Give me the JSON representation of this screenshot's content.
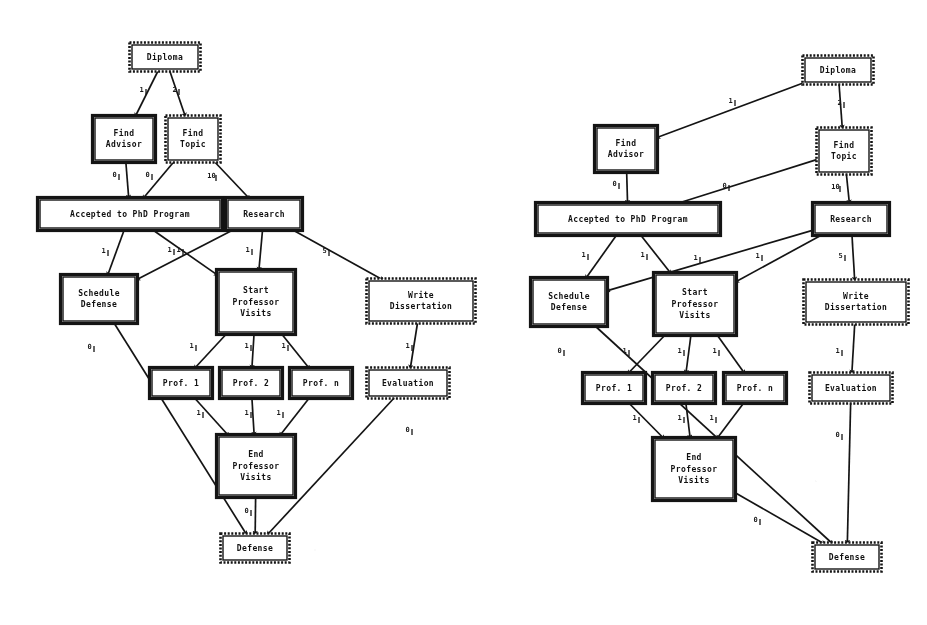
{
  "figure": {
    "kind": "task-graph-pair",
    "background_color": "#ffffff",
    "ink_color": "#141414"
  },
  "nodes": {
    "diploma": "Diploma",
    "find_advisor": "Find\nAdvisor",
    "find_topic": "Find\nTopic",
    "accepted": "Accepted to PhD Program",
    "research": "Research",
    "schedule_defense": "Schedule\nDefense",
    "start_visits": "Start\nProfessor\nVisits",
    "write_dissertation": "Write\nDissertation",
    "prof1": "Prof. 1",
    "prof2": "Prof. 2",
    "profn": "Prof. n",
    "evaluation": "Evaluation",
    "end_visits": "End\nProfessor\nVisits",
    "defense": "Defense"
  },
  "left_diagram": {
    "name": "left-task-graph",
    "nodes": [
      {
        "id": "diploma",
        "label": "Diploma",
        "x": 132,
        "y": 45,
        "w": 66,
        "h": 24,
        "style": "dotted",
        "lines": [
          "Diploma"
        ],
        "font": 8
      },
      {
        "id": "find_advisor",
        "label": "Find Advisor",
        "x": 95,
        "y": 118,
        "w": 58,
        "h": 42,
        "style": "solid",
        "lines": [
          "Find",
          "Advisor"
        ],
        "font": 8
      },
      {
        "id": "find_topic",
        "label": "Find Topic",
        "x": 168,
        "y": 118,
        "w": 50,
        "h": 42,
        "style": "dotted",
        "lines": [
          "Find",
          "Topic"
        ],
        "font": 8
      },
      {
        "id": "accepted",
        "label": "Accepted to PhD Program",
        "x": 40,
        "y": 200,
        "w": 180,
        "h": 28,
        "style": "solid",
        "lines": [
          "Accepted to PhD Program"
        ],
        "font": 8
      },
      {
        "id": "research",
        "label": "Research",
        "x": 228,
        "y": 200,
        "w": 72,
        "h": 28,
        "style": "solid",
        "lines": [
          "Research"
        ],
        "font": 8
      },
      {
        "id": "schedule_defense",
        "label": "Schedule Defense",
        "x": 63,
        "y": 277,
        "w": 72,
        "h": 44,
        "style": "solid",
        "lines": [
          "Schedule",
          "Defense"
        ],
        "font": 8
      },
      {
        "id": "start_visits",
        "label": "Start Professor Visits",
        "x": 219,
        "y": 272,
        "w": 74,
        "h": 60,
        "style": "solid",
        "lines": [
          "Start",
          "Professor",
          "Visits"
        ],
        "font": 8
      },
      {
        "id": "write_dissertation",
        "label": "Write Dissertation",
        "x": 369,
        "y": 281,
        "w": 104,
        "h": 40,
        "style": "dotted",
        "lines": [
          "Write",
          "Dissertation"
        ],
        "font": 8
      },
      {
        "id": "prof1",
        "label": "Prof. 1",
        "x": 152,
        "y": 370,
        "w": 58,
        "h": 26,
        "style": "solid",
        "lines": [
          "Prof. 1"
        ],
        "font": 8
      },
      {
        "id": "prof2",
        "label": "Prof. 2",
        "x": 222,
        "y": 370,
        "w": 58,
        "h": 26,
        "style": "solid",
        "lines": [
          "Prof. 2"
        ],
        "font": 8
      },
      {
        "id": "profn",
        "label": "Prof. n",
        "x": 292,
        "y": 370,
        "w": 58,
        "h": 26,
        "style": "solid",
        "lines": [
          "Prof. n"
        ],
        "font": 8
      },
      {
        "id": "evaluation",
        "label": "Evaluation",
        "x": 369,
        "y": 370,
        "w": 78,
        "h": 26,
        "style": "dotted",
        "lines": [
          "Evaluation"
        ],
        "font": 8
      },
      {
        "id": "end_visits",
        "label": "End Professor Visits",
        "x": 219,
        "y": 437,
        "w": 74,
        "h": 58,
        "style": "solid",
        "lines": [
          "End",
          "Professor",
          "Visits"
        ],
        "font": 8
      },
      {
        "id": "defense",
        "label": "Defense",
        "x": 223,
        "y": 536,
        "w": 64,
        "h": 24,
        "style": "dotted",
        "lines": [
          "Defense"
        ],
        "font": 8
      }
    ],
    "edges": [
      {
        "from": "diploma",
        "to": "find_advisor",
        "weight": "1",
        "lx": 146,
        "ly": 92
      },
      {
        "from": "diploma",
        "to": "find_topic",
        "weight": "2",
        "lx": 179,
        "ly": 92
      },
      {
        "from": "find_advisor",
        "to": "accepted",
        "weight": "0",
        "lx": 119,
        "ly": 177
      },
      {
        "from": "find_topic",
        "to": "accepted",
        "weight": "0",
        "lx": 152,
        "ly": 177
      },
      {
        "from": "find_topic",
        "to": "research",
        "weight": "10",
        "lx": 216,
        "ly": 178
      },
      {
        "from": "accepted",
        "to": "schedule_defense",
        "weight": "1",
        "lx": 108,
        "ly": 253
      },
      {
        "from": "accepted",
        "to": "start_visits",
        "weight": "1",
        "lx": 183,
        "ly": 252
      },
      {
        "from": "research",
        "to": "schedule_defense",
        "weight": "1",
        "lx": 174,
        "ly": 252
      },
      {
        "from": "research",
        "to": "start_visits",
        "weight": "1",
        "lx": 252,
        "ly": 252
      },
      {
        "from": "research",
        "to": "write_dissertation",
        "weight": "5",
        "lx": 329,
        "ly": 253
      },
      {
        "from": "schedule_defense",
        "to": "defense",
        "weight": "0",
        "lx": 94,
        "ly": 349
      },
      {
        "from": "start_visits",
        "to": "prof1",
        "weight": "1",
        "lx": 196,
        "ly": 348
      },
      {
        "from": "start_visits",
        "to": "prof2",
        "weight": "1",
        "lx": 251,
        "ly": 348
      },
      {
        "from": "start_visits",
        "to": "profn",
        "weight": "1",
        "lx": 288,
        "ly": 348
      },
      {
        "from": "write_dissertation",
        "to": "evaluation",
        "weight": "1",
        "lx": 412,
        "ly": 348
      },
      {
        "from": "prof1",
        "to": "end_visits",
        "weight": "1",
        "lx": 203,
        "ly": 415
      },
      {
        "from": "prof2",
        "to": "end_visits",
        "weight": "1",
        "lx": 251,
        "ly": 415
      },
      {
        "from": "profn",
        "to": "end_visits",
        "weight": "1",
        "lx": 283,
        "ly": 415
      },
      {
        "from": "evaluation",
        "to": "defense",
        "weight": "0",
        "lx": 412,
        "ly": 432
      },
      {
        "from": "end_visits",
        "to": "defense",
        "weight": "0",
        "lx": 251,
        "ly": 513
      }
    ]
  },
  "right_diagram": {
    "name": "right-task-graph",
    "nodes": [
      {
        "id": "diploma",
        "label": "Diploma",
        "x": 805,
        "y": 58,
        "w": 66,
        "h": 24,
        "style": "dotted",
        "lines": [
          "Diploma"
        ],
        "font": 8
      },
      {
        "id": "find_advisor",
        "label": "Find Advisor",
        "x": 597,
        "y": 128,
        "w": 58,
        "h": 42,
        "style": "solid",
        "lines": [
          "Find",
          "Advisor"
        ],
        "font": 8
      },
      {
        "id": "find_topic",
        "label": "Find Topic",
        "x": 819,
        "y": 130,
        "w": 50,
        "h": 42,
        "style": "dotted",
        "lines": [
          "Find",
          "Topic"
        ],
        "font": 8
      },
      {
        "id": "accepted",
        "label": "Accepted to PhD Program",
        "x": 538,
        "y": 205,
        "w": 180,
        "h": 28,
        "style": "solid",
        "lines": [
          "Accepted to PhD Program"
        ],
        "font": 8
      },
      {
        "id": "research",
        "label": "Research",
        "x": 815,
        "y": 205,
        "w": 72,
        "h": 28,
        "style": "solid",
        "lines": [
          "Research"
        ],
        "font": 8
      },
      {
        "id": "schedule_defense",
        "label": "Schedule Defense",
        "x": 533,
        "y": 280,
        "w": 72,
        "h": 44,
        "style": "solid",
        "lines": [
          "Schedule",
          "Defense"
        ],
        "font": 8
      },
      {
        "id": "start_visits",
        "label": "Start Professor Visits",
        "x": 656,
        "y": 275,
        "w": 78,
        "h": 58,
        "style": "solid",
        "lines": [
          "Start",
          "Professor",
          "Visits"
        ],
        "font": 8
      },
      {
        "id": "write_dissertation",
        "label": "Write Dissertation",
        "x": 806,
        "y": 282,
        "w": 100,
        "h": 40,
        "style": "dotted",
        "lines": [
          "Write",
          "Dissertation"
        ],
        "font": 8
      },
      {
        "id": "prof1",
        "label": "Prof. 1",
        "x": 585,
        "y": 375,
        "w": 58,
        "h": 26,
        "style": "solid",
        "lines": [
          "Prof. 1"
        ],
        "font": 8
      },
      {
        "id": "prof2",
        "label": "Prof. 2",
        "x": 655,
        "y": 375,
        "w": 58,
        "h": 26,
        "style": "solid",
        "lines": [
          "Prof. 2"
        ],
        "font": 8
      },
      {
        "id": "profn",
        "label": "Prof. n",
        "x": 726,
        "y": 375,
        "w": 58,
        "h": 26,
        "style": "solid",
        "lines": [
          "Prof. n"
        ],
        "font": 8
      },
      {
        "id": "evaluation",
        "label": "Evaluation",
        "x": 812,
        "y": 375,
        "w": 78,
        "h": 26,
        "style": "dotted",
        "lines": [
          "Evaluation"
        ],
        "font": 8
      },
      {
        "id": "end_visits",
        "label": "End Professor Visits",
        "x": 655,
        "y": 440,
        "w": 78,
        "h": 58,
        "style": "solid",
        "lines": [
          "End",
          "Professor",
          "Visits"
        ],
        "font": 8
      },
      {
        "id": "defense",
        "label": "Defense",
        "x": 815,
        "y": 545,
        "w": 64,
        "h": 24,
        "style": "dotted",
        "lines": [
          "Defense"
        ],
        "font": 8
      }
    ],
    "edges": [
      {
        "from": "diploma",
        "to": "find_advisor",
        "weight": "1",
        "lx": 735,
        "ly": 103
      },
      {
        "from": "diploma",
        "to": "find_topic",
        "weight": "2",
        "lx": 844,
        "ly": 105
      },
      {
        "from": "find_advisor",
        "to": "accepted",
        "weight": "0",
        "lx": 619,
        "ly": 186
      },
      {
        "from": "find_topic",
        "to": "accepted",
        "weight": "0",
        "lx": 729,
        "ly": 188
      },
      {
        "from": "find_topic",
        "to": "research",
        "weight": "10",
        "lx": 840,
        "ly": 189
      },
      {
        "from": "accepted",
        "to": "schedule_defense",
        "weight": "1",
        "lx": 588,
        "ly": 257
      },
      {
        "from": "accepted",
        "to": "start_visits",
        "weight": "1",
        "lx": 647,
        "ly": 257
      },
      {
        "from": "research",
        "to": "schedule_defense",
        "weight": "1",
        "lx": 700,
        "ly": 260
      },
      {
        "from": "research",
        "to": "start_visits",
        "weight": "1",
        "lx": 762,
        "ly": 258
      },
      {
        "from": "research",
        "to": "write_dissertation",
        "weight": "5",
        "lx": 845,
        "ly": 258
      },
      {
        "from": "schedule_defense",
        "to": "defense",
        "weight": "0",
        "lx": 564,
        "ly": 353
      },
      {
        "from": "start_visits",
        "to": "prof1",
        "weight": "1",
        "lx": 629,
        "ly": 353
      },
      {
        "from": "start_visits",
        "to": "prof2",
        "weight": "1",
        "lx": 684,
        "ly": 353
      },
      {
        "from": "start_visits",
        "to": "profn",
        "weight": "1",
        "lx": 719,
        "ly": 353
      },
      {
        "from": "write_dissertation",
        "to": "evaluation",
        "weight": "1",
        "lx": 842,
        "ly": 353
      },
      {
        "from": "prof1",
        "to": "end_visits",
        "weight": "1",
        "lx": 639,
        "ly": 420
      },
      {
        "from": "prof2",
        "to": "end_visits",
        "weight": "1",
        "lx": 684,
        "ly": 420
      },
      {
        "from": "profn",
        "to": "end_visits",
        "weight": "1",
        "lx": 716,
        "ly": 420
      },
      {
        "from": "evaluation",
        "to": "defense",
        "weight": "0",
        "lx": 842,
        "ly": 437
      },
      {
        "from": "end_visits",
        "to": "defense",
        "weight": "0",
        "lx": 760,
        "ly": 522
      }
    ]
  }
}
